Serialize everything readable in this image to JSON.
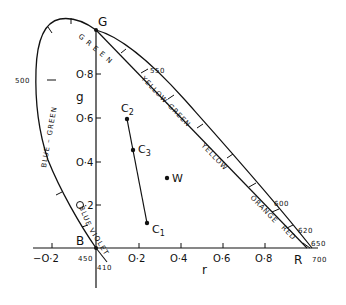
{
  "chart_data": {
    "type": "diagram",
    "title": "",
    "xlabel": "r",
    "ylabel": "g",
    "x_ticks": [
      "-0.2",
      "0.2",
      "0.4",
      "0.6",
      "0.8"
    ],
    "y_ticks": [
      "0.2",
      "0.4",
      "0.6",
      "0.8"
    ],
    "vertices": {
      "G": {
        "label": "G",
        "r": 0,
        "g": 1
      },
      "B": {
        "label": "B",
        "r": 0,
        "g": 0
      },
      "R": {
        "label": "R",
        "r": 1,
        "g": 0
      }
    },
    "wavelength_labels": [
      "500",
      "550",
      "600",
      "620",
      "650",
      "700",
      "450",
      "410"
    ],
    "color_bands": [
      "GREEN",
      "YELLOW-GREEN",
      "YELLOW",
      "ORANGE",
      "RED",
      "BLUE-GREEN",
      "BLUE",
      "VIOLET"
    ],
    "points": [
      {
        "label": "C1",
        "r": 0.25,
        "g": 0.11
      },
      {
        "label": "C2",
        "r": 0.17,
        "g": 0.59
      },
      {
        "label": "C3",
        "r": 0.2,
        "g": 0.45
      },
      {
        "label": "W",
        "r": 0.33,
        "g": 0.33
      }
    ],
    "segments": [
      {
        "from": "C2",
        "to": "C1",
        "through": "C3"
      }
    ],
    "axis_range": {
      "r": [
        -0.3,
        1.05
      ],
      "g": [
        -0.25,
        1.05
      ]
    }
  },
  "labels": {
    "G": "G",
    "B": "B",
    "R": "R",
    "x_axis": "r",
    "y_axis": "g",
    "xt_m02": "−O·2",
    "xt_02": "O·2",
    "xt_04": "O·4",
    "xt_06": "O·6",
    "xt_08": "O·8",
    "yt_02": "·2",
    "yt_04": "O·4",
    "yt_06": "O·6",
    "yt_08": "O·8",
    "wl_500": "500",
    "wl_550": "550",
    "wl_600": "600",
    "wl_620": "620",
    "wl_650": "650",
    "wl_700": "700",
    "wl_450": "450",
    "wl_410": "410",
    "band_green": "G R E E N",
    "band_yellow_green": "YELLOW-GREEN",
    "band_yellow": "YELLOW",
    "band_orange": "ORANGE",
    "band_red": "RED",
    "band_blue_green": "BLUE – GREEN",
    "band_blue": "BLUE",
    "band_violet": "VIOLET",
    "C1": "C",
    "C1_sub": "1",
    "C2": "C",
    "C2_sub": "2",
    "C3": "C",
    "C3_sub": "3",
    "W": "W"
  }
}
